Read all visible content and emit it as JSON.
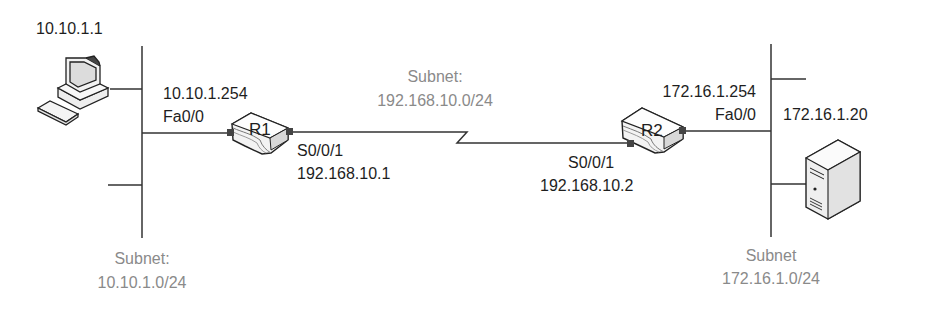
{
  "pc": {
    "ip": "10.10.1.1",
    "icon": "desktop-pc-icon"
  },
  "r1": {
    "name": "R1",
    "fa_ip": "10.10.1.254",
    "fa_iface": "Fa0/0",
    "serial_iface": "S0/0/1",
    "serial_ip": "192.168.10.1",
    "icon": "router-icon"
  },
  "r2": {
    "name": "R2",
    "fa_ip": "172.16.1.254",
    "fa_iface": "Fa0/0",
    "serial_iface": "S0/0/1",
    "serial_ip": "192.168.10.2",
    "icon": "router-icon"
  },
  "server": {
    "ip": "172.16.1.20",
    "icon": "server-icon"
  },
  "subnets": {
    "left": {
      "label": "Subnet:",
      "cidr": "10.10.1.0/24"
    },
    "wan": {
      "label": "Subnet:",
      "cidr": "192.168.10.0/24"
    },
    "right": {
      "label": "Subnet",
      "cidr": "172.16.1.0/24"
    }
  },
  "colors": {
    "text": "#1e1e1e",
    "subnet_text": "#8a8a8a",
    "line": "#333333"
  }
}
